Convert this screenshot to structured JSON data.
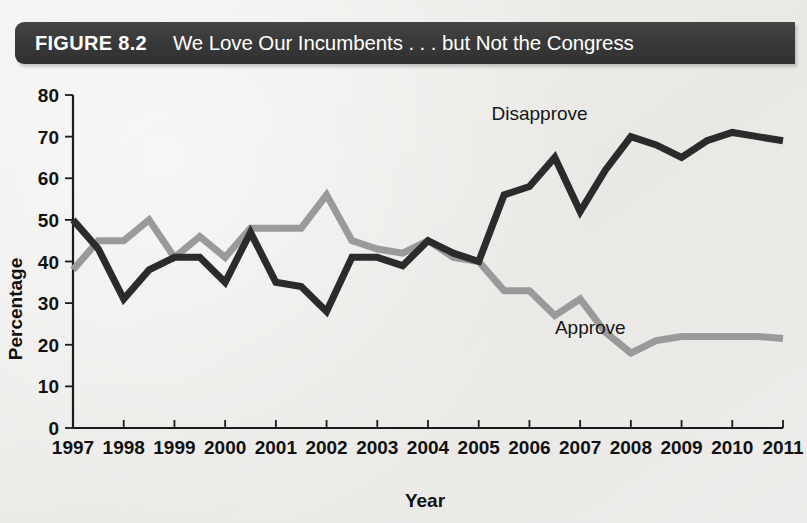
{
  "figure": {
    "number_label": "FIGURE 8.2",
    "title": "We Love Our Incumbents . . . but Not the Congress"
  },
  "colors": {
    "banner_background": "#3b3b3b",
    "banner_text": "#ffffff",
    "page_background": "#eeedeb",
    "disapprove_line": "#2b2b2b",
    "approve_line": "#9a9a9a",
    "axis": "#1b1b1b"
  },
  "chart_data": {
    "type": "line",
    "title": "We Love Our Incumbents . . . but Not the Congress",
    "xlabel": "Year",
    "ylabel": "Percentage",
    "ylim": [
      0,
      80
    ],
    "ytick_labels": [
      "0",
      "10",
      "20",
      "30",
      "40",
      "50",
      "60",
      "70",
      "80"
    ],
    "yticks": [
      0,
      10,
      20,
      30,
      40,
      50,
      60,
      70,
      80
    ],
    "xlim": [
      1997,
      2011
    ],
    "xtick_labels": [
      "1997",
      "1998",
      "1999",
      "2000",
      "2001",
      "2002",
      "2003",
      "2004",
      "2005",
      "2006",
      "2007",
      "2008",
      "2009",
      "2010",
      "2011"
    ],
    "xticks": [
      1997,
      1998,
      1999,
      2000,
      2001,
      2002,
      2003,
      2004,
      2005,
      2006,
      2007,
      2008,
      2009,
      2010,
      2011
    ],
    "grid": false,
    "legend_position": "inline-annotation",
    "annotations": [
      {
        "text": "Disapprove",
        "x": 2006.2,
        "y": 74
      },
      {
        "text": "Approve",
        "x": 2007.2,
        "y": 22.5
      }
    ],
    "x": [
      1997,
      1997.5,
      1998,
      1998.5,
      1999,
      1999.5,
      2000,
      2000.5,
      2001,
      2001.5,
      2002,
      2002.5,
      2003,
      2003.5,
      2004,
      2004.5,
      2005,
      2005.5,
      2006,
      2006.5,
      2007,
      2007.5,
      2008,
      2008.5,
      2009,
      2009.5,
      2010,
      2010.5,
      2011
    ],
    "series": [
      {
        "name": "Disapprove",
        "color": "#2b2b2b",
        "values": [
          50,
          43,
          31,
          38,
          41,
          41,
          35,
          47,
          35,
          34,
          28,
          41,
          41,
          39,
          45,
          42,
          40,
          56,
          58,
          65,
          52,
          62,
          70,
          68,
          65,
          69,
          71,
          70,
          69
        ]
      },
      {
        "name": "Approve",
        "color": "#9a9a9a",
        "values": [
          38,
          45,
          45,
          50,
          41,
          46,
          41,
          48,
          48,
          48,
          56,
          45,
          43,
          42,
          45,
          41,
          40,
          33,
          33,
          27,
          31,
          23,
          18,
          21,
          22,
          22,
          22,
          22,
          21.5
        ]
      }
    ]
  }
}
